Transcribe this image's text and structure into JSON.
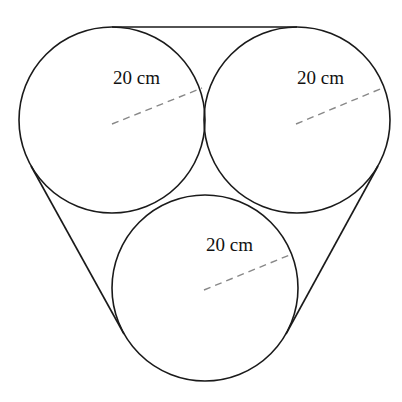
{
  "diagram": {
    "circles": [
      {
        "id": "top-left",
        "radius_label": "20 cm"
      },
      {
        "id": "top-right",
        "radius_label": "20 cm"
      },
      {
        "id": "bottom",
        "radius_label": "20 cm"
      }
    ],
    "colors": {
      "stroke": "#1a1a1a",
      "dashed_radius": "#888888",
      "background": "#ffffff"
    }
  }
}
